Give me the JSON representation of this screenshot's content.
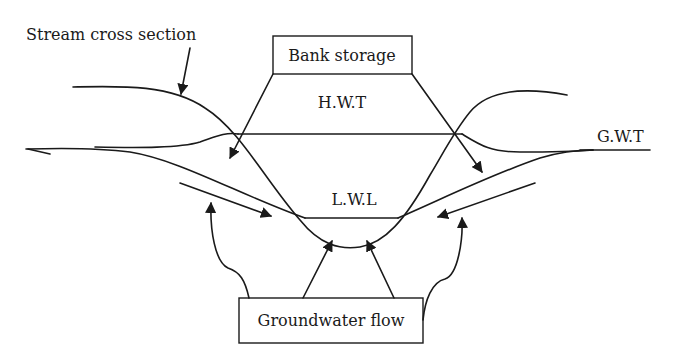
{
  "diagram": {
    "labels": {
      "stream_cross_section": "Stream cross section",
      "bank_storage": "Bank storage",
      "hwt": "H.W.T",
      "lwl": "L.W.L",
      "gwt": "G.W.T",
      "groundwater_flow": "Groundwater flow"
    },
    "colors": {
      "line": "#1a1a1a",
      "background": "#ffffff"
    }
  }
}
